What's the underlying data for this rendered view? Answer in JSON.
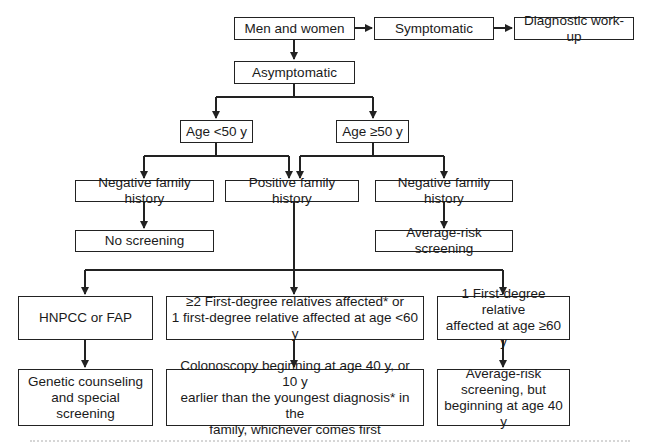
{
  "flowchart": {
    "title": "Colorectal cancer screening algorithm",
    "nodes": {
      "start": "Men and women",
      "symptomatic": "Symptomatic",
      "diagnostic": "Diagnostic work-up",
      "asymptomatic": "Asymptomatic",
      "age_lt50": "Age <50 y",
      "age_ge50": "Age ≥50 y",
      "neg_family_left": "Negative family history",
      "pos_family": "Positive family history",
      "neg_family_right": "Negative family history",
      "no_screening": "No screening",
      "avg_risk": "Average-risk screening",
      "hnpcc": "HNPCC or FAP",
      "ge2_line1": "≥2 First-degree relatives affected* or",
      "ge2_line2": "1 first-degree relative affected at age <60 y",
      "one_rel_line1": "1 First-degree relative",
      "one_rel_line2": "affected at age ≥60 y",
      "genetic_line1": "Genetic counseling",
      "genetic_line2": "and special screening",
      "colon_line1": "Colonoscopy beginning at age 40 y, or 10 y",
      "colon_line2": "earlier than the youngest diagnosis* in the",
      "colon_line3": "family, whichever comes first",
      "avg_late_line1": "Average-risk",
      "avg_late_line2": "screening, but",
      "avg_late_line3": "beginning at age 40 y"
    },
    "edges": [
      [
        "start",
        "symptomatic"
      ],
      [
        "symptomatic",
        "diagnostic"
      ],
      [
        "start",
        "asymptomatic"
      ],
      [
        "asymptomatic",
        "age_lt50"
      ],
      [
        "asymptomatic",
        "age_ge50"
      ],
      [
        "age_lt50",
        "neg_family_left"
      ],
      [
        "age_lt50",
        "pos_family"
      ],
      [
        "age_ge50",
        "pos_family"
      ],
      [
        "age_ge50",
        "neg_family_right"
      ],
      [
        "neg_family_left",
        "no_screening"
      ],
      [
        "neg_family_right",
        "avg_risk"
      ],
      [
        "pos_family",
        "hnpcc"
      ],
      [
        "pos_family",
        "ge2"
      ],
      [
        "pos_family",
        "one_rel"
      ],
      [
        "hnpcc",
        "genetic"
      ],
      [
        "ge2",
        "colon"
      ],
      [
        "one_rel",
        "avg_late"
      ]
    ],
    "colors": {
      "line": "#222222",
      "box_fill": "#ffffff",
      "text": "#1a1a1a"
    }
  }
}
